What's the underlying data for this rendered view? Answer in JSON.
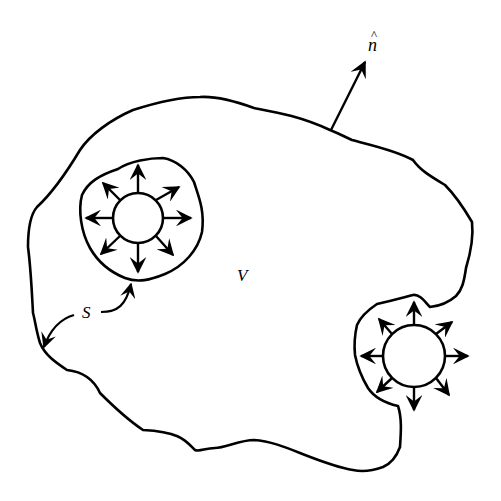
{
  "diagram": {
    "labels": {
      "volume": "V",
      "surface": "S",
      "normal": "n",
      "normal_hat": "^"
    },
    "colors": {
      "stroke": "#000000",
      "background": "#ffffff"
    },
    "elements": {
      "outer_surface": "outer-boundary",
      "normal_vector": "normal-arrow",
      "cavity_left": {
        "center": [
          138,
          218
        ],
        "radius": 25,
        "arrow_count": 8
      },
      "cavity_right": {
        "center": [
          414,
          355
        ],
        "radius": 31,
        "arrow_count": 8
      },
      "surface_pointers": 2
    }
  }
}
